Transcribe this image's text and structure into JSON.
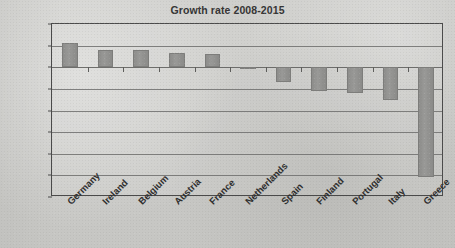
{
  "chart_data": {
    "type": "bar",
    "title": "Growth rate 2008-2015",
    "xlabel": "",
    "ylabel": "",
    "ylim": [
      -30,
      10
    ],
    "ytick_step": 5,
    "grid": true,
    "legend": false,
    "bar_color": "#8f8f8d",
    "categories": [
      "Germany",
      "Ireland",
      "Belgium",
      "Austria",
      "France",
      "Netherlands",
      "Spain",
      "Finland",
      "Portugal",
      "Italy",
      "Greece"
    ],
    "values": [
      5.7,
      4.0,
      4.0,
      3.2,
      3.0,
      -0.3,
      -3.4,
      -5.5,
      -6.0,
      -7.5,
      -25.4
    ],
    "ytick_labels": [
      "10%",
      "5%",
      "0%",
      "-5%",
      "-10%",
      "-15%",
      "-20%",
      "-25%",
      "-30%"
    ],
    "ytick_values": [
      10,
      5,
      0,
      -5,
      -10,
      -15,
      -20,
      -25,
      -30
    ]
  }
}
